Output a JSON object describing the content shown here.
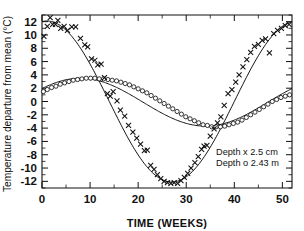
{
  "chart_data": {
    "type": "scatter",
    "title": "",
    "xlabel": "TIME (WEEKS)",
    "ylabel": "Temperature departure from mean (°C)",
    "xlim": [
      0,
      52
    ],
    "ylim": [
      -13,
      13
    ],
    "xticks": [
      0,
      10,
      20,
      30,
      40,
      50
    ],
    "xtick_labels": [
      "0",
      "10",
      "20",
      "30",
      "40",
      "50"
    ],
    "xminor_step": 5,
    "yticks": [
      12,
      10,
      8,
      6,
      4,
      2,
      0,
      -2,
      -4,
      -6,
      -8,
      -10,
      -12
    ],
    "ytick_labels": [
      "12",
      "10",
      "8",
      "6",
      "4",
      "2",
      "0",
      "-2",
      "-4",
      "-6",
      "-8",
      "-10",
      "-12"
    ],
    "grid": false,
    "legend_position": "inside-lower-right",
    "legend": [
      {
        "label": "Depth x 2.5 cm",
        "marker": "x"
      },
      {
        "label": "Depth o 2.43 m",
        "marker": "o"
      }
    ],
    "series": [
      {
        "name": "Depth x 2.5 cm",
        "marker": "x",
        "fit_curve": {
          "amplitude": 12.1,
          "phase_weeks": 1.0,
          "period_weeks": 52.0,
          "offset": 0.0,
          "description": "sinusoid: y = 12.1*cos(2*pi*(t-1)/52)"
        },
        "points": [
          {
            "x": 0.4,
            "y": 9.8
          },
          {
            "x": 1.1,
            "y": 11.3
          },
          {
            "x": 1.7,
            "y": 12.6
          },
          {
            "x": 2.2,
            "y": 11.6
          },
          {
            "x": 2.8,
            "y": 11.6
          },
          {
            "x": 3.3,
            "y": 12.2
          },
          {
            "x": 3.9,
            "y": 11.0
          },
          {
            "x": 4.6,
            "y": 11.3
          },
          {
            "x": 5.3,
            "y": 10.7
          },
          {
            "x": 6.2,
            "y": 11.2
          },
          {
            "x": 7.0,
            "y": 11.2
          },
          {
            "x": 8.0,
            "y": 9.5
          },
          {
            "x": 8.9,
            "y": 8.5
          },
          {
            "x": 9.5,
            "y": 8.2
          },
          {
            "x": 10.3,
            "y": 6.4
          },
          {
            "x": 11.0,
            "y": 6.2
          },
          {
            "x": 11.6,
            "y": 5.5
          },
          {
            "x": 12.3,
            "y": 5.6
          },
          {
            "x": 13.0,
            "y": 3.6
          },
          {
            "x": 13.6,
            "y": 1.2
          },
          {
            "x": 14.2,
            "y": 0.8
          },
          {
            "x": 14.8,
            "y": 1.5
          },
          {
            "x": 15.6,
            "y": 0.1
          },
          {
            "x": 16.3,
            "y": -1.3
          },
          {
            "x": 17.2,
            "y": -2.2
          },
          {
            "x": 18.0,
            "y": -3.6
          },
          {
            "x": 18.9,
            "y": -4.6
          },
          {
            "x": 19.7,
            "y": -5.5
          },
          {
            "x": 20.5,
            "y": -6.4
          },
          {
            "x": 21.3,
            "y": -7.4
          },
          {
            "x": 21.9,
            "y": -7.3
          },
          {
            "x": 22.6,
            "y": -9.6
          },
          {
            "x": 23.3,
            "y": -10.2
          },
          {
            "x": 24.0,
            "y": -11.0
          },
          {
            "x": 24.7,
            "y": -11.6
          },
          {
            "x": 25.4,
            "y": -12.0
          },
          {
            "x": 26.1,
            "y": -12.2
          },
          {
            "x": 26.8,
            "y": -12.3
          },
          {
            "x": 27.5,
            "y": -12.2
          },
          {
            "x": 28.2,
            "y": -12.3
          },
          {
            "x": 28.9,
            "y": -11.9
          },
          {
            "x": 29.6,
            "y": -11.4
          },
          {
            "x": 30.3,
            "y": -10.8
          },
          {
            "x": 31.0,
            "y": -10.0
          },
          {
            "x": 31.8,
            "y": -9.2
          },
          {
            "x": 32.5,
            "y": -8.3
          },
          {
            "x": 33.2,
            "y": -7.2
          },
          {
            "x": 33.7,
            "y": -6.7
          },
          {
            "x": 34.3,
            "y": -6.6
          },
          {
            "x": 35.0,
            "y": -5.2
          },
          {
            "x": 35.8,
            "y": -4.1
          },
          {
            "x": 36.5,
            "y": -3.2
          },
          {
            "x": 37.2,
            "y": -2.3
          },
          {
            "x": 37.9,
            "y": -0.6
          },
          {
            "x": 38.7,
            "y": 1.2
          },
          {
            "x": 39.5,
            "y": 1.8
          },
          {
            "x": 40.3,
            "y": 2.9
          },
          {
            "x": 41.0,
            "y": 4.0
          },
          {
            "x": 41.8,
            "y": 5.2
          },
          {
            "x": 42.6,
            "y": 6.3
          },
          {
            "x": 43.4,
            "y": 7.4
          },
          {
            "x": 44.2,
            "y": 8.3
          },
          {
            "x": 45.0,
            "y": 8.6
          },
          {
            "x": 45.8,
            "y": 9.2
          },
          {
            "x": 46.5,
            "y": 9.4
          },
          {
            "x": 47.3,
            "y": 7.3
          },
          {
            "x": 48.2,
            "y": 10.2
          },
          {
            "x": 49.0,
            "y": 10.7
          },
          {
            "x": 49.8,
            "y": 11.0
          },
          {
            "x": 50.6,
            "y": 11.4
          },
          {
            "x": 51.4,
            "y": 11.6
          }
        ]
      },
      {
        "name": "Depth o 2.43 m",
        "marker": "o",
        "fit_curve": {
          "amplitude": 3.6,
          "phase_weeks": 8.0,
          "period_weeks": 52.0,
          "offset": -0.1,
          "description": "sinusoid: y = -0.1 + 3.6*cos(2*pi*(t-8)/52)"
        },
        "points": [
          {
            "x": 0.3,
            "y": 1.5
          },
          {
            "x": 1.1,
            "y": 1.8
          },
          {
            "x": 2.0,
            "y": 2.1
          },
          {
            "x": 2.9,
            "y": 2.3
          },
          {
            "x": 3.8,
            "y": 2.6
          },
          {
            "x": 4.7,
            "y": 2.8
          },
          {
            "x": 5.6,
            "y": 3.0
          },
          {
            "x": 6.5,
            "y": 3.2
          },
          {
            "x": 7.4,
            "y": 3.3
          },
          {
            "x": 8.3,
            "y": 3.4
          },
          {
            "x": 9.2,
            "y": 3.5
          },
          {
            "x": 10.1,
            "y": 3.5
          },
          {
            "x": 11.0,
            "y": 3.5
          },
          {
            "x": 11.9,
            "y": 3.4
          },
          {
            "x": 12.8,
            "y": 3.4
          },
          {
            "x": 13.7,
            "y": 3.3
          },
          {
            "x": 14.6,
            "y": 3.2
          },
          {
            "x": 15.5,
            "y": 3.1
          },
          {
            "x": 16.4,
            "y": 2.9
          },
          {
            "x": 17.3,
            "y": 2.7
          },
          {
            "x": 18.2,
            "y": 2.5
          },
          {
            "x": 19.1,
            "y": 2.2
          },
          {
            "x": 20.0,
            "y": 1.9
          },
          {
            "x": 20.9,
            "y": 1.6
          },
          {
            "x": 21.8,
            "y": 1.3
          },
          {
            "x": 22.7,
            "y": 0.9
          },
          {
            "x": 23.6,
            "y": 0.5
          },
          {
            "x": 24.5,
            "y": 0.1
          },
          {
            "x": 25.4,
            "y": -0.3
          },
          {
            "x": 26.3,
            "y": -0.7
          },
          {
            "x": 27.2,
            "y": -1.1
          },
          {
            "x": 28.1,
            "y": -1.5
          },
          {
            "x": 29.0,
            "y": -1.9
          },
          {
            "x": 29.9,
            "y": -2.3
          },
          {
            "x": 30.8,
            "y": -2.6
          },
          {
            "x": 31.7,
            "y": -2.9
          },
          {
            "x": 32.6,
            "y": -3.2
          },
          {
            "x": 33.5,
            "y": -3.5
          },
          {
            "x": 34.4,
            "y": -3.6
          },
          {
            "x": 35.3,
            "y": -3.8
          },
          {
            "x": 36.2,
            "y": -3.8
          },
          {
            "x": 37.1,
            "y": -3.8
          },
          {
            "x": 38.0,
            "y": -3.7
          },
          {
            "x": 38.9,
            "y": -3.5
          },
          {
            "x": 39.8,
            "y": -3.3
          },
          {
            "x": 40.7,
            "y": -3.1
          },
          {
            "x": 41.6,
            "y": -2.8
          },
          {
            "x": 42.5,
            "y": -2.4
          },
          {
            "x": 43.4,
            "y": -2.0
          },
          {
            "x": 44.3,
            "y": -1.6
          },
          {
            "x": 45.2,
            "y": -1.2
          },
          {
            "x": 46.1,
            "y": -0.8
          },
          {
            "x": 47.0,
            "y": -0.4
          },
          {
            "x": 47.9,
            "y": 0.0
          },
          {
            "x": 48.8,
            "y": 0.3
          },
          {
            "x": 49.7,
            "y": 0.6
          },
          {
            "x": 50.6,
            "y": 0.8
          },
          {
            "x": 51.5,
            "y": 1.0
          }
        ]
      }
    ]
  },
  "axes": {
    "x_title": "TIME (WEEKS)",
    "y_title": "Temperature departure from mean (°C)"
  },
  "legend": {
    "line1": "Depth x 2.5 cm",
    "line2": "Depth o 2.43 m"
  },
  "colors": {
    "ink": "#111111",
    "background": "#ffffff"
  }
}
